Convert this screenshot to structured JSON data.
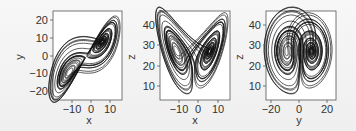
{
  "chart_data": [
    {
      "type": "line",
      "title": "",
      "xlabel": "x",
      "ylabel": "y",
      "xlim": [
        -17,
        19
      ],
      "ylim": [
        -24,
        26
      ],
      "xticks": [
        -10,
        0,
        10
      ],
      "yticks": [
        20,
        10,
        0,
        -10,
        -20
      ],
      "grid": false,
      "description": "Lorenz attractor projection onto x-y plane"
    },
    {
      "type": "line",
      "title": "",
      "xlabel": "x",
      "ylabel": "z",
      "xlim": [
        -17,
        19
      ],
      "ylim": [
        3,
        47
      ],
      "xticks": [
        -10,
        0,
        10
      ],
      "yticks": [
        40,
        30,
        20,
        10
      ],
      "grid": false,
      "description": "Lorenz attractor projection onto x-z plane (butterfly)"
    },
    {
      "type": "line",
      "title": "",
      "xlabel": "y",
      "ylabel": "z",
      "xlim": [
        -24,
        26
      ],
      "ylim": [
        3,
        47
      ],
      "xticks": [
        -20,
        0,
        20
      ],
      "yticks": [
        40,
        30,
        20,
        10
      ],
      "grid": false,
      "description": "Lorenz attractor projection onto y-z plane"
    }
  ],
  "panels": [
    {
      "xlabel": "x",
      "ylabel": "y",
      "xticks": [
        "−10",
        "0",
        "10"
      ],
      "yticks": [
        "20",
        "10",
        "0",
        "−10",
        "−20"
      ]
    },
    {
      "xlabel": "x",
      "ylabel": "z",
      "xticks": [
        "−10",
        "0",
        "10"
      ],
      "yticks": [
        "40",
        "30",
        "20",
        "10"
      ]
    },
    {
      "xlabel": "y",
      "ylabel": "z",
      "xticks": [
        "−20",
        "0",
        "20"
      ],
      "yticks": [
        "40",
        "30",
        "20",
        "10"
      ]
    }
  ]
}
